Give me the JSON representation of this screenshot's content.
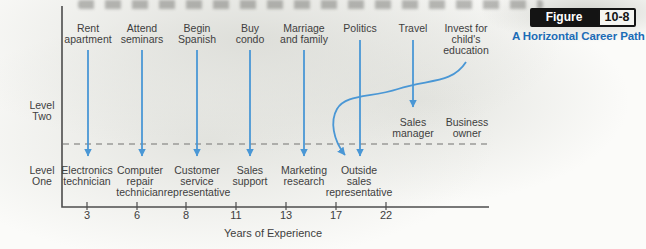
{
  "figure": {
    "badge_label": "Figure",
    "badge_number": "10-8",
    "title": "A Horizontal Career Path"
  },
  "colors": {
    "arrow_blue": "#4a97d5",
    "title_blue": "#1b6cb6",
    "text": "#3e3e3e",
    "axis": "#4d4d4d",
    "dashed": "#9a9a98",
    "badge_bg": "#141414",
    "badge_num_bg": "#f5f5f1"
  },
  "levels": [
    {
      "id": "two",
      "lines": [
        "Level",
        "Two"
      ],
      "x": 42,
      "top": 100
    },
    {
      "id": "one",
      "lines": [
        "Level",
        "One"
      ],
      "x": 42,
      "top": 165
    }
  ],
  "events": [
    {
      "label": "Rent apartment",
      "lines": [
        "Rent",
        "apartment"
      ],
      "x": 88,
      "arrow": {
        "kind": "straight",
        "y1": 50,
        "y2": 156
      }
    },
    {
      "label": "Attend seminars",
      "lines": [
        "Attend",
        "seminars"
      ],
      "x": 142,
      "arrow": {
        "kind": "straight",
        "y1": 50,
        "y2": 156
      }
    },
    {
      "label": "Begin Spanish",
      "lines": [
        "Begin",
        "Spanish"
      ],
      "x": 197,
      "arrow": {
        "kind": "straight",
        "y1": 50,
        "y2": 156
      }
    },
    {
      "label": "Buy condo",
      "lines": [
        "Buy",
        "condo"
      ],
      "x": 250,
      "arrow": {
        "kind": "straight",
        "y1": 50,
        "y2": 156
      }
    },
    {
      "label": "Marriage and family",
      "lines": [
        "Marriage",
        "and family"
      ],
      "x": 304,
      "arrow": {
        "kind": "straight",
        "y1": 50,
        "y2": 156
      }
    },
    {
      "label": "Politics",
      "lines": [
        "Politics"
      ],
      "x": 360,
      "arrow": {
        "kind": "straight",
        "y1": 40,
        "y2": 156
      }
    },
    {
      "label": "Travel",
      "lines": [
        "Travel"
      ],
      "x": 413,
      "arrow": {
        "kind": "straight",
        "y1": 40,
        "y2": 107
      }
    },
    {
      "label": "Invest for child's education",
      "lines": [
        "Invest for",
        "child's",
        "education"
      ],
      "x": 466,
      "arrow": {
        "kind": "curved"
      }
    }
  ],
  "curved_arrow": {
    "from": "Invest for child's education",
    "to": "Outside sales representative",
    "path": "M 466 62 C 452 84 428 79 398 89 C 370 98 346 94 337 109 C 330 121 333 140 345 155"
  },
  "jobs_level_one": [
    {
      "label": "Electronics technician",
      "lines": [
        "Electronics",
        "technician"
      ],
      "x": 87
    },
    {
      "label": "Computer repair technician",
      "lines": [
        "Computer",
        "repair",
        "technician"
      ],
      "x": 140
    },
    {
      "label": "Customer service representative",
      "lines": [
        "Customer",
        "service",
        "representative"
      ],
      "x": 197
    },
    {
      "label": "Sales support",
      "lines": [
        "Sales",
        "support"
      ],
      "x": 250
    },
    {
      "label": "Marketing research",
      "lines": [
        "Marketing",
        "research"
      ],
      "x": 304
    },
    {
      "label": "Outside sales representative",
      "lines": [
        "Outside",
        "sales",
        "representative"
      ],
      "x": 359
    }
  ],
  "jobs_level_two": [
    {
      "label": "Sales manager",
      "lines": [
        "Sales",
        "manager"
      ],
      "x": 413
    },
    {
      "label": "Business owner",
      "lines": [
        "Business",
        "owner"
      ],
      "x": 467
    }
  ],
  "axis": {
    "label": "Years of Experience",
    "ticks": [
      {
        "label": "3",
        "x": 87
      },
      {
        "label": "6",
        "x": 137
      },
      {
        "label": "8",
        "x": 186
      },
      {
        "label": "11",
        "x": 236
      },
      {
        "label": "13",
        "x": 286
      },
      {
        "label": "17",
        "x": 336
      },
      {
        "label": "22",
        "x": 386
      }
    ]
  }
}
